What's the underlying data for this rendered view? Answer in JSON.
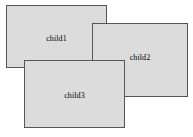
{
  "canvas": {
    "width": 193,
    "height": 137,
    "background_color": "#ffffff"
  },
  "style": {
    "panel_fill_color": "#dcdcdc",
    "panel_border_color": "#555555",
    "label_text_color": "#000000"
  },
  "panels": [
    {
      "id": "child1",
      "label": "child1",
      "x": 6,
      "y": 5,
      "width": 101,
      "height": 63,
      "stack_order": 1
    },
    {
      "id": "child2",
      "label": "child2",
      "x": 92,
      "y": 23,
      "width": 96,
      "height": 74,
      "stack_order": 2
    },
    {
      "id": "child3",
      "label": "child3",
      "x": 24,
      "y": 60,
      "width": 101,
      "height": 68,
      "stack_order": 3
    }
  ]
}
